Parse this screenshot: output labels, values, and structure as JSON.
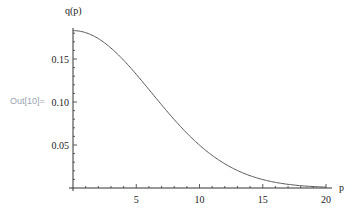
{
  "cell": {
    "out_label": "Out[10]="
  },
  "chart_data": {
    "type": "line",
    "title": "",
    "xlabel": "p",
    "ylabel": "q(p)",
    "xlim": [
      0,
      20
    ],
    "ylim": [
      0,
      0.19
    ],
    "grid": false,
    "x_ticks": [
      "5",
      "10",
      "15",
      "20"
    ],
    "y_ticks": [
      "0.05",
      "0.10",
      "0.15"
    ],
    "series": [
      {
        "name": "q(p)",
        "x": [
          0,
          1,
          2,
          3,
          4,
          5,
          6,
          7,
          8,
          9,
          10,
          11,
          12,
          13,
          14,
          15,
          16,
          17,
          18,
          19,
          20
        ],
        "values": [
          0.183,
          0.18,
          0.171,
          0.158,
          0.141,
          0.122,
          0.103,
          0.084,
          0.067,
          0.052,
          0.04,
          0.029,
          0.021,
          0.015,
          0.01,
          0.006,
          0.004,
          0.003,
          0.002,
          0.001,
          0.0006
        ]
      }
    ],
    "line_color": "#555555"
  }
}
